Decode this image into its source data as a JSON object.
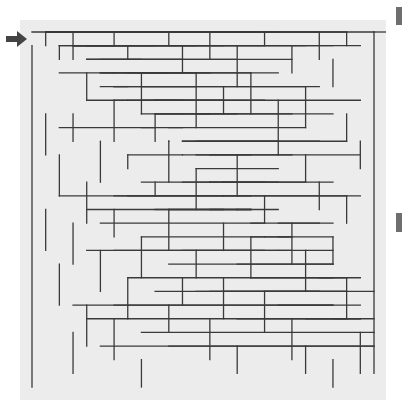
{
  "puzzle": {
    "type": "maze",
    "grid": {
      "cols": 25,
      "rows": 26
    },
    "entrance": {
      "side": "left",
      "row": 0,
      "label": "start-arrow"
    },
    "exit": {
      "side": "bottom-right",
      "row": 25
    },
    "colors": {
      "wall": "#3a3a3a",
      "background": "#ececec",
      "arrow": "#444444",
      "marker": "#6e6e6e"
    },
    "walls_h": [
      [
        0,
        0,
        25
      ],
      [
        3,
        2,
        6
      ],
      [
        7,
        2,
        9
      ],
      [
        12,
        2,
        17
      ],
      [
        20,
        3,
        22
      ],
      [
        1,
        4,
        3
      ],
      [
        5,
        4,
        11
      ],
      [
        13,
        4,
        14
      ],
      [
        16,
        4,
        19
      ],
      [
        21,
        4,
        23
      ],
      [
        0,
        5,
        1
      ],
      [
        3,
        5,
        12
      ],
      [
        14,
        5,
        22
      ],
      [
        23,
        5,
        25
      ],
      [
        1,
        6,
        4
      ],
      [
        5,
        6,
        7
      ],
      [
        12,
        6,
        14
      ],
      [
        16,
        6,
        17
      ],
      [
        20,
        6,
        22
      ],
      [
        1,
        7,
        2
      ],
      [
        4,
        7,
        6
      ],
      [
        9,
        7,
        11
      ],
      [
        12,
        7,
        16
      ],
      [
        18,
        7,
        20
      ],
      [
        2,
        8,
        4
      ],
      [
        5,
        8,
        9
      ],
      [
        11,
        8,
        13
      ],
      [
        15,
        8,
        19
      ],
      [
        22,
        8,
        25
      ],
      [
        1,
        9,
        4
      ],
      [
        6,
        9,
        11
      ],
      [
        13,
        9,
        16
      ],
      [
        19,
        9,
        21
      ],
      [
        0,
        10,
        1
      ],
      [
        3,
        10,
        7
      ],
      [
        8,
        10,
        10
      ],
      [
        13,
        10,
        15
      ],
      [
        17,
        10,
        22
      ],
      [
        23,
        10,
        25
      ],
      [
        2,
        11,
        4
      ],
      [
        7,
        11,
        8
      ],
      [
        11,
        11,
        14
      ],
      [
        16,
        11,
        22
      ],
      [
        1,
        12,
        3
      ],
      [
        4,
        12,
        8
      ],
      [
        10,
        12,
        18
      ],
      [
        19,
        12,
        25
      ],
      [
        0,
        13,
        2
      ],
      [
        3,
        13,
        5
      ],
      [
        6,
        13,
        12
      ],
      [
        13,
        13,
        16
      ],
      [
        19,
        13,
        23
      ],
      [
        1,
        14,
        3
      ],
      [
        5,
        14,
        9
      ],
      [
        11,
        14,
        18
      ],
      [
        19,
        14,
        23
      ],
      [
        2,
        15,
        4
      ],
      [
        6,
        15,
        11
      ],
      [
        13,
        15,
        16
      ],
      [
        17,
        15,
        20
      ],
      [
        21,
        15,
        24
      ],
      [
        0,
        16,
        1
      ],
      [
        3,
        16,
        8
      ],
      [
        9,
        16,
        12
      ],
      [
        14,
        16,
        17
      ],
      [
        18,
        16,
        22
      ],
      [
        1,
        17,
        3
      ],
      [
        5,
        17,
        9
      ],
      [
        11,
        17,
        14
      ],
      [
        15,
        17,
        17
      ],
      [
        19,
        17,
        21
      ],
      [
        0,
        18,
        2
      ],
      [
        3,
        18,
        6
      ],
      [
        8,
        18,
        11
      ],
      [
        13,
        18,
        15
      ],
      [
        16,
        18,
        18
      ],
      [
        20,
        18,
        24
      ],
      [
        2,
        19,
        5
      ],
      [
        6,
        19,
        8
      ],
      [
        9,
        19,
        13
      ],
      [
        15,
        19,
        18
      ],
      [
        1,
        20,
        3
      ],
      [
        4,
        20,
        6
      ],
      [
        7,
        20,
        10
      ],
      [
        11,
        20,
        13
      ],
      [
        16,
        20,
        20
      ],
      [
        21,
        20,
        25
      ],
      [
        0,
        21,
        3
      ],
      [
        4,
        21,
        5
      ],
      [
        8,
        21,
        12
      ],
      [
        14,
        21,
        18
      ],
      [
        1,
        22,
        2
      ],
      [
        6,
        22,
        9
      ],
      [
        11,
        22,
        13
      ],
      [
        15,
        22,
        16
      ],
      [
        17,
        22,
        20
      ],
      [
        21,
        22,
        24
      ],
      [
        0,
        23,
        1
      ],
      [
        8,
        23,
        11
      ],
      [
        12,
        23,
        14
      ],
      [
        18,
        23,
        20
      ],
      [
        1,
        24,
        4
      ],
      [
        5,
        24,
        7
      ],
      [
        9,
        24,
        11
      ],
      [
        12,
        24,
        17
      ],
      [
        18,
        24,
        21
      ],
      [
        0,
        26,
        25
      ]
    ],
    "walls_v": [
      [
        0,
        1,
        26
      ],
      [
        25,
        0,
        25
      ],
      [
        1,
        0,
        1
      ],
      [
        3,
        0,
        2
      ],
      [
        6,
        0,
        1
      ],
      [
        10,
        0,
        1
      ],
      [
        13,
        0,
        2
      ],
      [
        17,
        0,
        1
      ],
      [
        21,
        0,
        2
      ],
      [
        23,
        0,
        1
      ],
      [
        2,
        1,
        2
      ],
      [
        7,
        1,
        2
      ],
      [
        11,
        1,
        3
      ],
      [
        15,
        1,
        4
      ],
      [
        19,
        1,
        3
      ],
      [
        4,
        3,
        5
      ],
      [
        8,
        3,
        6
      ],
      [
        12,
        3,
        7
      ],
      [
        16,
        3,
        6
      ],
      [
        20,
        4,
        7
      ],
      [
        22,
        2,
        4
      ],
      [
        1,
        6,
        9
      ],
      [
        3,
        6,
        8
      ],
      [
        6,
        5,
        8
      ],
      [
        9,
        6,
        8
      ],
      [
        14,
        4,
        6
      ],
      [
        18,
        5,
        9
      ],
      [
        23,
        6,
        8
      ],
      [
        2,
        9,
        12
      ],
      [
        5,
        8,
        11
      ],
      [
        7,
        9,
        10
      ],
      [
        10,
        8,
        11
      ],
      [
        15,
        9,
        12
      ],
      [
        20,
        9,
        11
      ],
      [
        24,
        8,
        10
      ],
      [
        4,
        11,
        14
      ],
      [
        9,
        11,
        12
      ],
      [
        12,
        10,
        13
      ],
      [
        17,
        12,
        14
      ],
      [
        21,
        11,
        13
      ],
      [
        23,
        12,
        14
      ],
      [
        1,
        13,
        16
      ],
      [
        3,
        14,
        17
      ],
      [
        6,
        13,
        15
      ],
      [
        10,
        13,
        16
      ],
      [
        14,
        14,
        16
      ],
      [
        19,
        14,
        17
      ],
      [
        5,
        16,
        19
      ],
      [
        8,
        15,
        18
      ],
      [
        12,
        16,
        18
      ],
      [
        16,
        15,
        18
      ],
      [
        20,
        16,
        19
      ],
      [
        22,
        15,
        17
      ],
      [
        2,
        17,
        20
      ],
      [
        7,
        18,
        21
      ],
      [
        11,
        18,
        20
      ],
      [
        14,
        18,
        21
      ],
      [
        17,
        19,
        22
      ],
      [
        23,
        18,
        21
      ],
      [
        4,
        20,
        23
      ],
      [
        6,
        21,
        24
      ],
      [
        10,
        20,
        22
      ],
      [
        13,
        21,
        24
      ],
      [
        19,
        21,
        24
      ],
      [
        24,
        22,
        25
      ],
      [
        3,
        22,
        25
      ],
      [
        8,
        24,
        26
      ],
      [
        15,
        23,
        25
      ],
      [
        20,
        23,
        25
      ],
      [
        22,
        24,
        26
      ]
    ]
  },
  "markers": [
    {
      "name": "top-marker"
    },
    {
      "name": "middle-marker"
    }
  ]
}
